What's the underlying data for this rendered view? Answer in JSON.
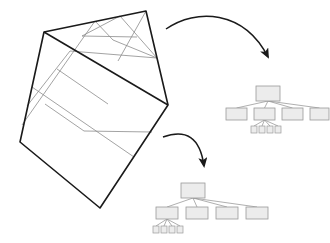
{
  "figure": {
    "background_color": "#ffffff",
    "width": 330,
    "height": 243
  },
  "colors": {
    "outline_stroke": "#1a1a1a",
    "grid_stroke": "#8c8c8c",
    "node_fill": "#ececec",
    "node_stroke": "#9a9a9a",
    "edge_stroke": "#9a9a9a",
    "arrow_stroke": "#1a1a1a"
  },
  "quadtree_region": {
    "name": "rotated-subdivided-square",
    "rotation_degrees": -35,
    "corners": [
      {
        "label": "top-left",
        "x": 44,
        "y": 32
      },
      {
        "label": "top-right",
        "x": 146,
        "y": 11
      },
      {
        "label": "bottom-right",
        "x": 168,
        "y": 105
      },
      {
        "label": "bottom-left",
        "x": 100,
        "y": 208
      },
      {
        "label": "left",
        "x": 20,
        "y": 142
      }
    ],
    "description": "Square region recursively split into quadrants; the upper-right quadrant and an upper-left quadrant are subdivided a further level."
  },
  "arrows": [
    {
      "name": "arrow-to-upper-tree",
      "from": "top of subdivided region",
      "to": "root of upper quadtree",
      "direction": "right-down"
    },
    {
      "name": "arrow-to-lower-tree",
      "from": "right of subdivided region",
      "to": "root of lower quadtree",
      "direction": "right-down"
    }
  ],
  "trees": [
    {
      "name": "upper-quadtree",
      "root": {
        "label": "",
        "x": 268,
        "y": 86,
        "w": 24,
        "h": 15
      },
      "children": [
        {
          "label": "",
          "x": 226,
          "y": 108,
          "w": 21,
          "h": 12,
          "expanded": false
        },
        {
          "label": "",
          "x": 254,
          "y": 108,
          "w": 21,
          "h": 12,
          "expanded": true
        },
        {
          "label": "",
          "x": 282,
          "y": 108,
          "w": 21,
          "h": 12,
          "expanded": false
        },
        {
          "label": "",
          "x": 310,
          "y": 108,
          "w": 19,
          "h": 12,
          "expanded": false
        }
      ],
      "grandchildren": [
        {
          "label": "",
          "x": 251,
          "y": 126,
          "w": 6,
          "h": 7
        },
        {
          "label": "",
          "x": 259,
          "y": 126,
          "w": 6,
          "h": 7
        },
        {
          "label": "",
          "x": 267,
          "y": 126,
          "w": 6,
          "h": 7
        },
        {
          "label": "",
          "x": 275,
          "y": 126,
          "w": 6,
          "h": 7
        }
      ],
      "child_count": 4,
      "grandchild_count": 4,
      "expanded_child_index": 1
    },
    {
      "name": "lower-quadtree",
      "root": {
        "label": "",
        "x": 193,
        "y": 183,
        "w": 24,
        "h": 15
      },
      "children": [
        {
          "label": "",
          "x": 156,
          "y": 207,
          "w": 22,
          "h": 12,
          "expanded": true
        },
        {
          "label": "",
          "x": 186,
          "y": 207,
          "w": 22,
          "h": 12,
          "expanded": false
        },
        {
          "label": "",
          "x": 216,
          "y": 207,
          "w": 22,
          "h": 12,
          "expanded": false
        },
        {
          "label": "",
          "x": 246,
          "y": 207,
          "w": 22,
          "h": 12,
          "expanded": false
        }
      ],
      "grandchildren": [
        {
          "label": "",
          "x": 153,
          "y": 226,
          "w": 6,
          "h": 7
        },
        {
          "label": "",
          "x": 161,
          "y": 226,
          "w": 6,
          "h": 7
        },
        {
          "label": "",
          "x": 169,
          "y": 226,
          "w": 6,
          "h": 7
        },
        {
          "label": "",
          "x": 177,
          "y": 226,
          "w": 6,
          "h": 7
        }
      ],
      "child_count": 4,
      "grandchild_count": 4,
      "expanded_child_index": 0
    }
  ]
}
